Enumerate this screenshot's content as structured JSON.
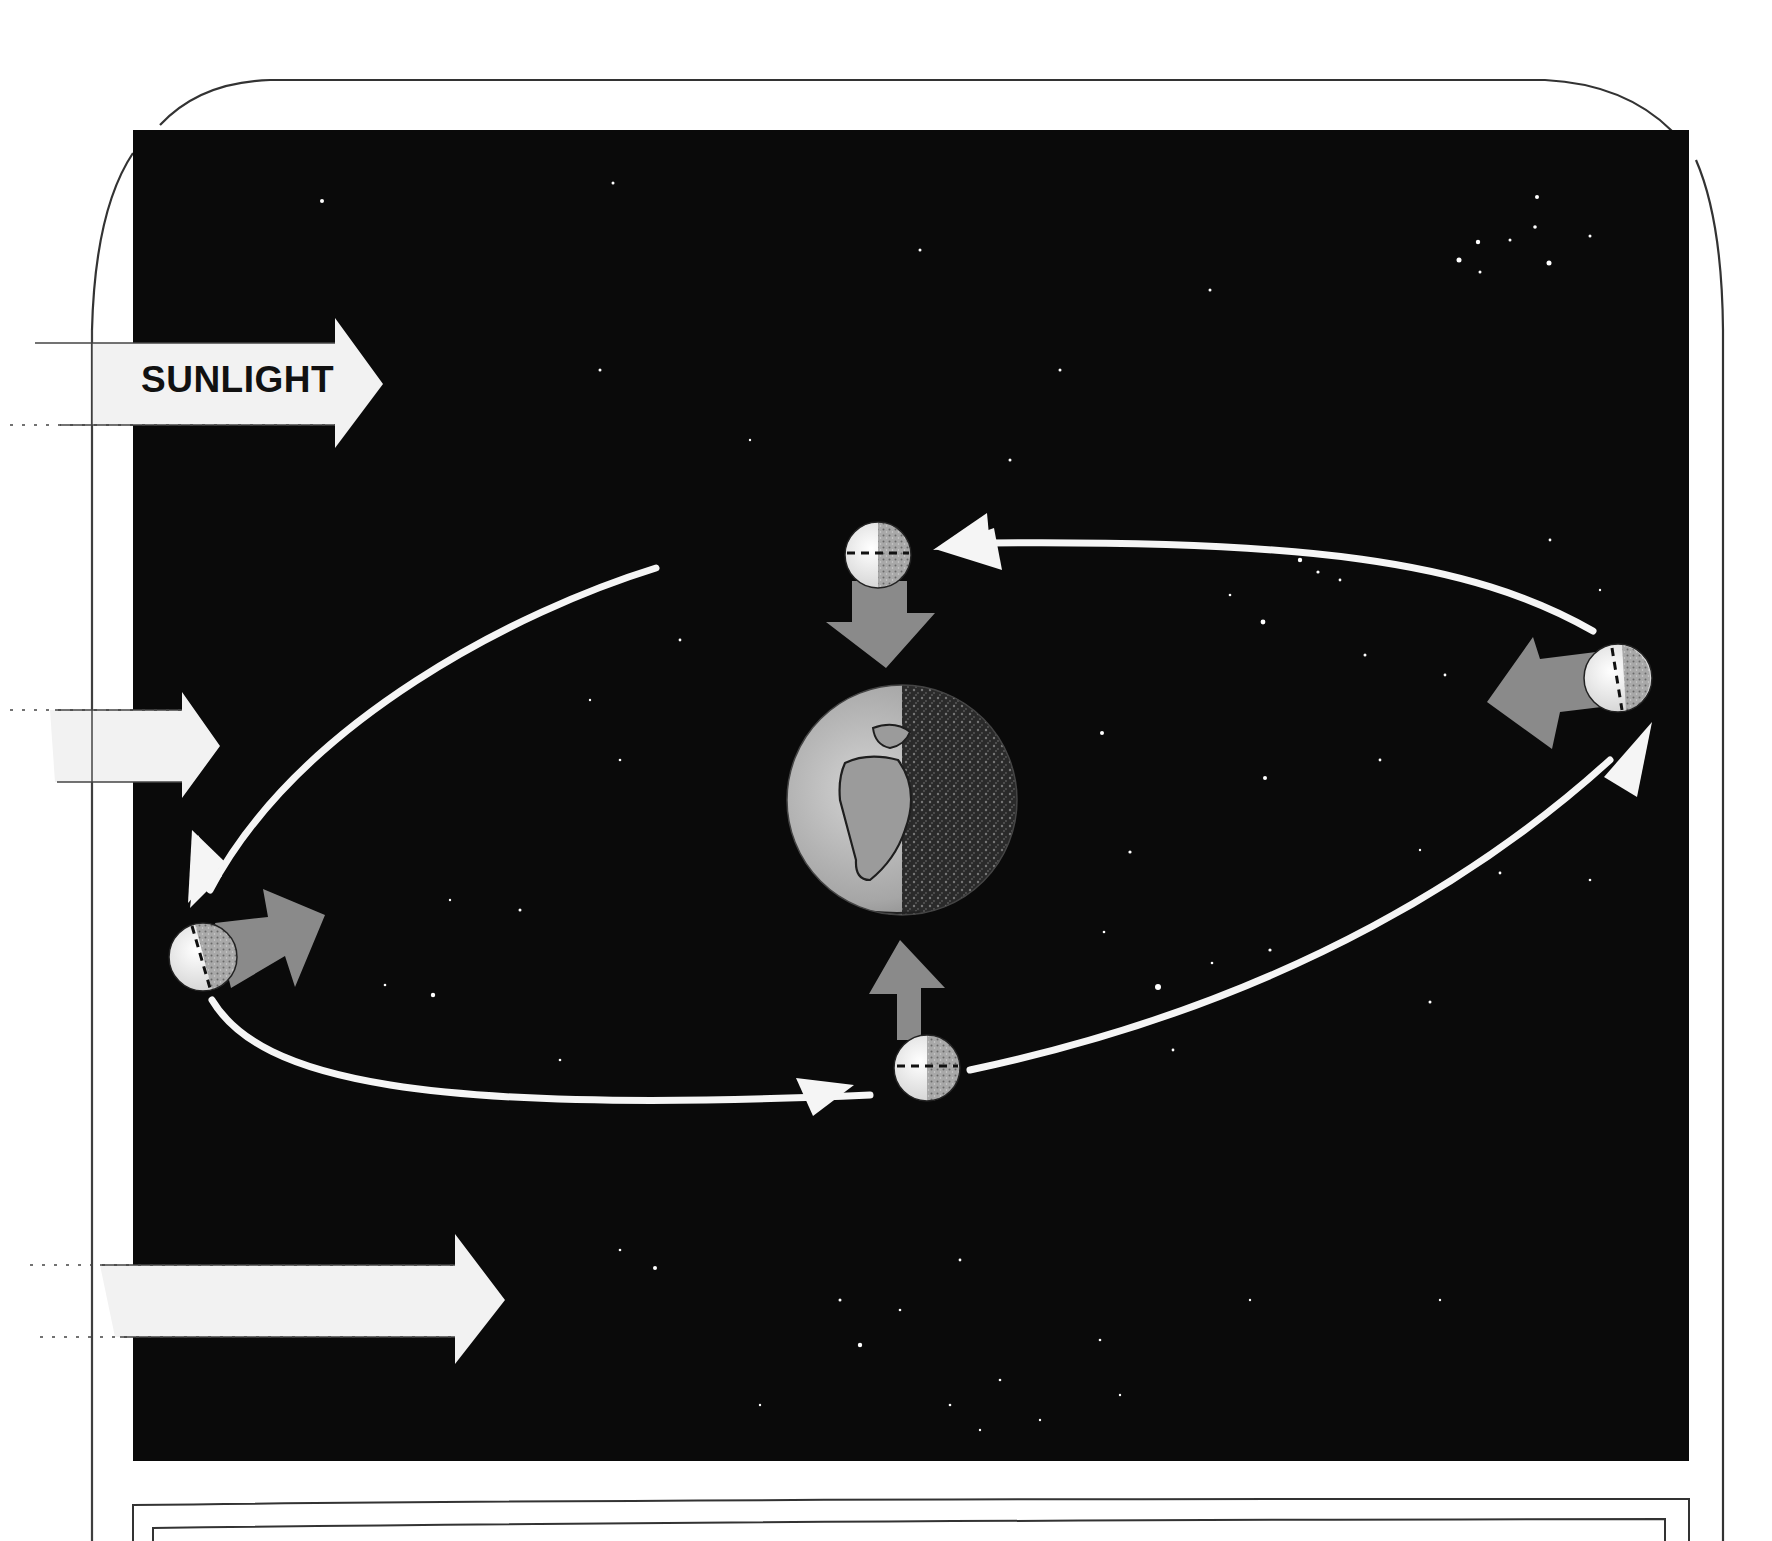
{
  "diagram": {
    "labels": {
      "sunlight": "SUNLIGHT"
    },
    "colors": {
      "space": "#0a0a0a",
      "frame_line": "#333333",
      "sunlight_arrow": "#f2f2f2",
      "orbit_arrow": "#f5f5f5",
      "gravity_arrow": "#8a8a8a",
      "moon_lit": "#eeeeee",
      "moon_dark": "#9a9a9a",
      "earth_lit": "#b8b8b8",
      "earth_dark": "#3a3a3a"
    },
    "sunlight_arrows": [
      {
        "name": "sunlight-arrow-top",
        "has_label": true
      },
      {
        "name": "sunlight-arrow-middle",
        "has_label": false
      },
      {
        "name": "sunlight-arrow-bottom",
        "has_label": false
      }
    ],
    "earth": {
      "center": [
        902,
        800
      ],
      "radius": 115,
      "lit_side": "left"
    },
    "moons": [
      {
        "position": "top",
        "center": [
          878,
          555
        ],
        "radius": 33,
        "arrow_toward_earth": "down"
      },
      {
        "position": "right",
        "center": [
          1618,
          678
        ],
        "radius": 34,
        "arrow_toward_earth": "left"
      },
      {
        "position": "bottom",
        "center": [
          927,
          1068
        ],
        "radius": 33,
        "arrow_toward_earth": "up"
      },
      {
        "position": "left",
        "center": [
          203,
          957
        ],
        "radius": 34,
        "arrow_toward_earth": "right"
      }
    ],
    "orbit": {
      "direction": "counterclockwise-in-view",
      "segments": 4
    }
  }
}
